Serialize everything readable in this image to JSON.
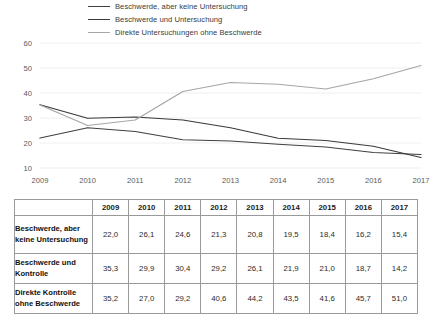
{
  "legend": {
    "items": [
      {
        "label": "Beschwerde, aber keine Untersuchung",
        "color": "#404040"
      },
      {
        "label": "Beschwerde und Untersuchung",
        "color": "#3a3a3a"
      },
      {
        "label": "Direkte Untersuchungen ohne Beschwerde",
        "color": "#a6a6a6"
      }
    ]
  },
  "chart_data": {
    "type": "line",
    "title": "",
    "xlabel": "",
    "ylabel": "",
    "categories": [
      "2009",
      "2010",
      "2011",
      "2012",
      "2013",
      "2014",
      "2015",
      "2016",
      "2017"
    ],
    "ylim": [
      10,
      60
    ],
    "yticks": [
      10,
      20,
      30,
      40,
      50,
      60
    ],
    "ytick_labels": [
      "10",
      "20",
      "30",
      "40",
      "50",
      "60"
    ],
    "grid": true,
    "legend_position": "top",
    "series": [
      {
        "name": "Beschwerde, aber keine Untersuchung",
        "color": "#404040",
        "values": [
          22.0,
          26.1,
          24.6,
          21.3,
          20.8,
          19.5,
          18.4,
          16.2,
          15.4
        ]
      },
      {
        "name": "Beschwerde und Untersuchung",
        "color": "#3a3a3a",
        "values": [
          35.3,
          29.9,
          30.4,
          29.2,
          26.1,
          21.9,
          21.0,
          18.7,
          14.2
        ]
      },
      {
        "name": "Direkte Untersuchungen ohne Beschwerde",
        "color": "#a6a6a6",
        "values": [
          35.2,
          27.0,
          29.2,
          40.6,
          44.2,
          43.5,
          41.6,
          45.7,
          51.0
        ]
      }
    ]
  },
  "table": {
    "corner_label": "",
    "columns": [
      "2009",
      "2010",
      "2011",
      "2012",
      "2013",
      "2014",
      "2015",
      "2016",
      "2017"
    ],
    "rows": [
      {
        "label": "Beschwerde, aber keine Untersuchung",
        "values": [
          "22,0",
          "26,1",
          "24,6",
          "21,3",
          "20,8",
          "19,5",
          "18,4",
          "16,2",
          "15,4"
        ]
      },
      {
        "label": "Beschwerde und Kontrolle",
        "values": [
          "35,3",
          "29,9",
          "30,4",
          "29,2",
          "26,1",
          "21,9",
          "21,0",
          "18,7",
          "14,2"
        ]
      },
      {
        "label": "Direkte Kontrolle ohne Beschwerde",
        "values": [
          "35,2",
          "27,0",
          "29,2",
          "40,6",
          "44,2",
          "43,5",
          "41,6",
          "45,7",
          "51,0"
        ]
      }
    ]
  }
}
